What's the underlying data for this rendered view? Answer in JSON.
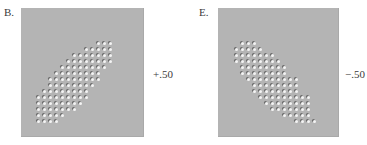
{
  "figure": {
    "panels": [
      {
        "id": "B",
        "label": "B.",
        "correlation_label": "+.50",
        "correlation": 0.5,
        "box": {
          "x": 21,
          "y": 8,
          "w": 122,
          "h": 128
        },
        "dot_spacing": 6,
        "rows": [
          {
            "y": 42,
            "x0": 97,
            "n": 3
          },
          {
            "y": 48,
            "x0": 85,
            "n": 5
          },
          {
            "y": 54,
            "x0": 73,
            "n": 7
          },
          {
            "y": 60,
            "x0": 67,
            "n": 8
          },
          {
            "y": 66,
            "x0": 61,
            "n": 8
          },
          {
            "y": 72,
            "x0": 55,
            "n": 8
          },
          {
            "y": 78,
            "x0": 49,
            "n": 9
          },
          {
            "y": 84,
            "x0": 49,
            "n": 8
          },
          {
            "y": 90,
            "x0": 43,
            "n": 8
          },
          {
            "y": 96,
            "x0": 37,
            "n": 9
          },
          {
            "y": 102,
            "x0": 37,
            "n": 8
          },
          {
            "y": 108,
            "x0": 37,
            "n": 7
          },
          {
            "y": 114,
            "x0": 37,
            "n": 5
          },
          {
            "y": 120,
            "x0": 37,
            "n": 4
          }
        ]
      },
      {
        "id": "E",
        "label": "E.",
        "correlation_label": "−.50",
        "correlation": -0.5,
        "box": {
          "x": 218,
          "y": 8,
          "w": 120,
          "h": 128
        },
        "dot_spacing": 6,
        "rows": [
          {
            "y": 42,
            "x0": 241,
            "n": 3
          },
          {
            "y": 48,
            "x0": 235,
            "n": 5
          },
          {
            "y": 54,
            "x0": 235,
            "n": 7
          },
          {
            "y": 60,
            "x0": 235,
            "n": 8
          },
          {
            "y": 66,
            "x0": 241,
            "n": 8
          },
          {
            "y": 72,
            "x0": 241,
            "n": 8
          },
          {
            "y": 78,
            "x0": 247,
            "n": 9
          },
          {
            "y": 84,
            "x0": 253,
            "n": 8
          },
          {
            "y": 90,
            "x0": 253,
            "n": 8
          },
          {
            "y": 96,
            "x0": 259,
            "n": 9
          },
          {
            "y": 102,
            "x0": 265,
            "n": 8
          },
          {
            "y": 108,
            "x0": 271,
            "n": 7
          },
          {
            "y": 114,
            "x0": 283,
            "n": 5
          },
          {
            "y": 120,
            "x0": 295,
            "n": 4
          }
        ]
      }
    ]
  },
  "chart_data": [
    {
      "type": "scatter",
      "title": "B.",
      "annotation": "+.50",
      "correlation": 0.5,
      "description": "Elliptical cloud of points on a regular grid, rising from lower-left to upper-right",
      "grid": false,
      "legend": null
    },
    {
      "type": "scatter",
      "title": "E.",
      "annotation": "−.50",
      "correlation": -0.5,
      "description": "Elliptical cloud of points on a regular grid, falling from upper-left to lower-right",
      "grid": false,
      "legend": null
    }
  ]
}
